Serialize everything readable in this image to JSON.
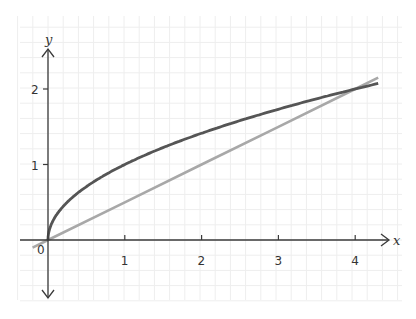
{
  "chart_data": {
    "type": "line",
    "title": "",
    "xlabel": "x",
    "ylabel": "y",
    "xlim": [
      -0.35,
      4.4
    ],
    "ylim": [
      -0.75,
      2.5
    ],
    "grid": true,
    "x_ticks": [
      1,
      2,
      3,
      4
    ],
    "x_tick_labels": [
      "1",
      "2",
      "3",
      "4"
    ],
    "y_ticks": [
      1,
      2
    ],
    "y_tick_labels": [
      "1",
      "2"
    ],
    "origin_label": "0",
    "series": [
      {
        "name": "y = √x",
        "color": "#555555",
        "x": [
          0,
          0.05,
          0.25,
          0.5,
          1,
          1.5,
          2,
          2.5,
          3,
          3.5,
          4,
          4.3
        ],
        "y": [
          0,
          0.22,
          0.5,
          0.71,
          1,
          1.22,
          1.41,
          1.58,
          1.73,
          1.87,
          2,
          2.07
        ]
      },
      {
        "name": "y = x/2",
        "color": "#a8a8a8",
        "x": [
          -0.2,
          0,
          1,
          2,
          3,
          4,
          4.3
        ],
        "y": [
          -0.1,
          0,
          0.5,
          1,
          1.5,
          2,
          2.15
        ]
      }
    ],
    "intersections": [
      [
        0,
        0
      ],
      [
        4,
        2
      ]
    ]
  },
  "colors": {
    "grid": "#eeeeee",
    "axis": "#3a3a3a",
    "curve": "#555555",
    "line": "#a8a8a8"
  }
}
